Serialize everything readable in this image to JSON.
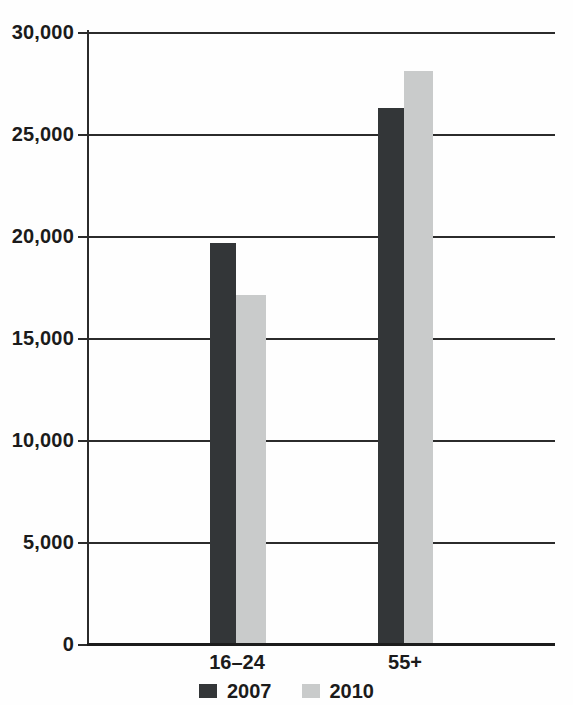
{
  "chart_data": {
    "type": "bar",
    "title": "",
    "subtitle": "",
    "xlabel": "",
    "ylabel": "",
    "categories": [
      "16–24",
      "55+"
    ],
    "series": [
      {
        "name": "2007",
        "color": "#333638",
        "values": [
          19650,
          26300
        ]
      },
      {
        "name": "2010",
        "color": "#c9cbcb",
        "values": [
          17100,
          28100
        ]
      }
    ],
    "ylim": [
      0,
      30000
    ],
    "y_ticks": [
      0,
      5000,
      10000,
      15000,
      20000,
      25000,
      30000
    ],
    "y_tick_labels": [
      "0",
      "5,000",
      "10,000",
      "15,000",
      "20,000",
      "25,000",
      "30,000"
    ],
    "grid": true,
    "grid_axis": "y",
    "legend_position": "bottom",
    "legend_entries": [
      "2007",
      "2010"
    ]
  },
  "colors": {
    "series_2007": "#333638",
    "series_2010": "#c9cbcb",
    "axis": "#1c1c1c",
    "grid": "#2b2b2b",
    "text": "#1b1b1b",
    "background": "#fefefe"
  }
}
